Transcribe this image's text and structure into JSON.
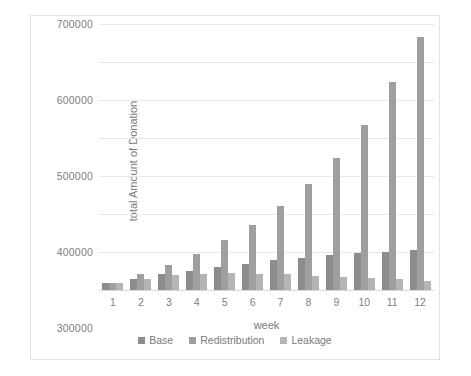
{
  "chart_data": {
    "type": "bar",
    "title": "",
    "xlabel": "week",
    "ylabel": "total Amount of Donation",
    "categories": [
      "1",
      "2",
      "3",
      "4",
      "5",
      "6",
      "7",
      "8",
      "9",
      "10",
      "11",
      "12"
    ],
    "ylim": [
      0,
      700000
    ],
    "ytick_step": 100000,
    "yticks": [
      "0",
      "100000",
      "200000",
      "300000",
      "400000",
      "500000",
      "600000",
      "700000"
    ],
    "grid": true,
    "legend_position": "bottom",
    "series": [
      {
        "name": "Base",
        "color": "#8c8c8c",
        "values": [
          18000,
          30000,
          41000,
          51000,
          61000,
          69000,
          78000,
          85000,
          91000,
          97000,
          101000,
          106000
        ]
      },
      {
        "name": "Redistribution",
        "color": "#9f9f9f",
        "values": [
          18000,
          41000,
          66000,
          95000,
          131000,
          171000,
          220000,
          279000,
          347000,
          434000,
          547000,
          666000
        ]
      },
      {
        "name": "Leakage",
        "color": "#b5b5b5",
        "values": [
          18000,
          29000,
          39000,
          43000,
          44000,
          43000,
          41000,
          37000,
          34000,
          32000,
          28000,
          25000
        ]
      }
    ]
  }
}
